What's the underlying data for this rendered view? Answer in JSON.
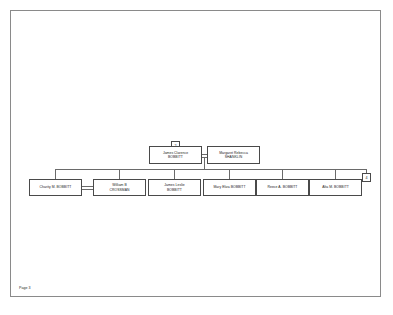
{
  "page": {
    "footer_label": "Page 3"
  },
  "chart": {
    "type": "family-tree",
    "reference_tags": {
      "ancestor": "2",
      "continuation": "4"
    },
    "parents": [
      {
        "lines": [
          "James Clarence",
          "BOBBITT"
        ]
      },
      {
        "lines": [
          "Margaret Rebecca",
          "SHANKLIN"
        ]
      }
    ],
    "children": [
      {
        "lines": [
          "Charity M. BOBBITT"
        ]
      },
      {
        "lines": [
          "William B",
          "CROSSMAN"
        ]
      },
      {
        "lines": [
          "James Leslie",
          "BOBBITT"
        ]
      },
      {
        "lines": [
          "Mary Eliza BOBBITT"
        ]
      },
      {
        "lines": [
          "Reece A. BOBBITT"
        ]
      },
      {
        "lines": [
          "Alta M. BOBBITT"
        ]
      }
    ]
  }
}
